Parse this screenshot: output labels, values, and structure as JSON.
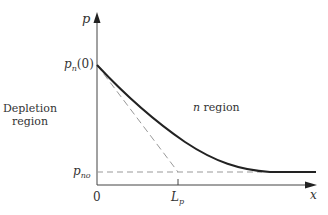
{
  "diagram": {
    "axes": {
      "y_label": "p",
      "x_label": "x",
      "origin_label": "0"
    },
    "labels": {
      "pn0_base": "p",
      "pn0_sub": "n",
      "pn0_arg": "(0)",
      "pno_base": "p",
      "pno_sub": "no",
      "lp_base": "L",
      "lp_sub": "p",
      "depletion_line1": "Depletion",
      "depletion_line2": "region",
      "n_region_n": "n",
      "n_region_text": " region"
    },
    "colors": {
      "curve": "#222222",
      "axis": "#444444",
      "dashed": "#999999",
      "text": "#333333"
    }
  }
}
